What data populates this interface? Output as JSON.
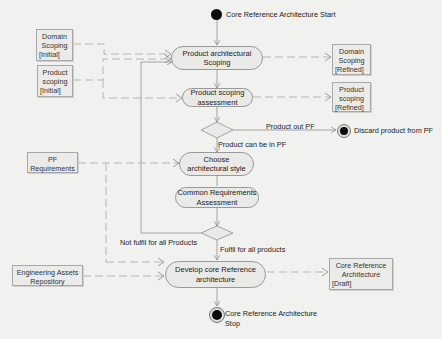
{
  "diagram": {
    "type": "UML activity diagram",
    "start": {
      "label": "Core Reference Architecture Start"
    },
    "end": {
      "label_line1": "Core Reference Architecture",
      "label_line2": "Stop"
    },
    "discard": {
      "label": "Discard product from PF"
    },
    "activities": [
      {
        "id": "a1",
        "line1": "Product architectural",
        "line2": "Scoping"
      },
      {
        "id": "a2",
        "line1": "Product scoping",
        "line2": "assessment"
      },
      {
        "id": "a3",
        "line1": "Choose",
        "line2": "architectural style"
      },
      {
        "id": "a4",
        "line1": "Common Requirements",
        "line2": "Assessment"
      },
      {
        "id": "a5",
        "line1": "Develop core Reference",
        "line2": "architecture"
      }
    ],
    "objects": [
      {
        "id": "o1",
        "line1": "Domain",
        "line2": "Scoping",
        "state": "[Initial]"
      },
      {
        "id": "o2",
        "line1": "Product",
        "line2": "scoping",
        "state": "[Initial]"
      },
      {
        "id": "o3",
        "line1": "Domain",
        "line2": "Scoping",
        "state": "[Refined]"
      },
      {
        "id": "o4",
        "line1": "Product",
        "line2": "scoping",
        "state": "[Refined]"
      },
      {
        "id": "o5",
        "line1": "PF",
        "line2": "Requirements"
      },
      {
        "id": "o6",
        "line1": "Engineering Assets",
        "line2": "Repository"
      },
      {
        "id": "o7",
        "line1": "Core Reference",
        "line2": "Architecture",
        "state": "[Draft]"
      }
    ],
    "guards": {
      "out_pf": "Product out PF",
      "in_pf": "Product can be in PF",
      "not_fulfil": "Not fulfil for all Products",
      "fulfil": "Fulfil for all products"
    },
    "colors": {
      "background": "#f1f1ef",
      "activity_fill": "#e9e9e7",
      "activity_border": "#999999",
      "object_fill": "#ebebe9",
      "edge": "#9a9a9a",
      "node": "#0c0c0c"
    }
  }
}
